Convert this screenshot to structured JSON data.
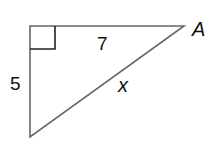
{
  "diagram": {
    "type": "right-triangle",
    "vertices": {
      "top_left": [
        30,
        26
      ],
      "A": [
        184,
        26
      ],
      "bottom": [
        30,
        137
      ]
    },
    "right_angle_at": "top_left",
    "labels": {
      "vertex_A": "A",
      "top_side": "7",
      "left_side": "5",
      "hypotenuse": "x"
    },
    "stroke_color": "#555555"
  }
}
